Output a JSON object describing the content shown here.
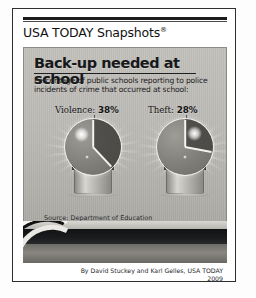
{
  "masthead": {
    "title": "USA TODAY Snapshots",
    "registered_mark": "®"
  },
  "graphic": {
    "headline": "Back-up needed at school",
    "subtitle": "Percentage of public schools reporting to police incidents of crime that occurred at school:",
    "source": "Source: Department of Education"
  },
  "byline": {
    "credit": "By David Stuckey and Karl Gelles, USA TODAY",
    "year": "2009"
  },
  "chart_data": {
    "type": "pie",
    "title": "Back-up needed at school",
    "subtitle": "Percentage of public schools reporting to police incidents of crime that occurred at school:",
    "categories": [
      "Violence",
      "Theft"
    ],
    "values": [
      38,
      28
    ],
    "unit": "%",
    "series": [
      {
        "name": "Violence",
        "label": "Violence: 38%",
        "value": 38,
        "value_text": "38%"
      },
      {
        "name": "Theft",
        "label": "Theft: 28%",
        "value": 28,
        "value_text": "28%"
      }
    ],
    "legend": "none",
    "grid": false,
    "source": "Source: Department of Education",
    "note": "Each value drawn as a highlighted wedge on a police-beacon shaped pie, starting at 12 o'clock clockwise.",
    "colors": {
      "panel": "#bdbbb6",
      "ink": "#17181a",
      "wedge_outline": "#f4f3f0",
      "dome": "#807e79"
    }
  }
}
